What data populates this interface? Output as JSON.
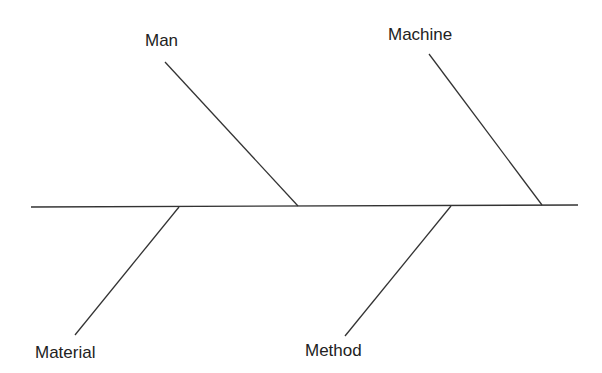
{
  "diagram": {
    "type": "fishbone",
    "line_color": "#333333",
    "text_color": "#222222",
    "background": "#ffffff",
    "spine": {
      "x1": 31,
      "y1": 207,
      "x2": 578,
      "y2": 205
    },
    "bones": [
      {
        "id": "man",
        "label": "Man",
        "side": "top",
        "x1": 165,
        "y1": 62,
        "x2": 298,
        "y2": 206,
        "label_x": 145,
        "label_y": 32
      },
      {
        "id": "machine",
        "label": "Machine",
        "side": "top",
        "x1": 429,
        "y1": 54,
        "x2": 542,
        "y2": 205,
        "label_x": 388,
        "label_y": 26
      },
      {
        "id": "material",
        "label": "Material",
        "side": "bottom",
        "x1": 179,
        "y1": 207,
        "x2": 75,
        "y2": 335,
        "label_x": 35,
        "label_y": 344
      },
      {
        "id": "method",
        "label": "Method",
        "side": "bottom",
        "x1": 451,
        "y1": 206,
        "x2": 345,
        "y2": 336,
        "label_x": 305,
        "label_y": 342
      }
    ]
  },
  "labels": {
    "man": "Man",
    "machine": "Machine",
    "material": "Material",
    "method": "Method"
  }
}
